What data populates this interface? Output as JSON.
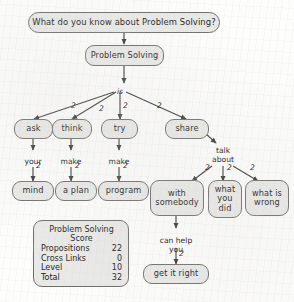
{
  "title_node": {
    "text": "What do you know about Problem Solving?"
  },
  "root_node": {
    "text": "Problem Solving"
  },
  "root_link": {
    "label": "is"
  },
  "level1": [
    {
      "name": "ask",
      "text": "ask"
    },
    {
      "name": "think",
      "text": "think"
    },
    {
      "name": "try",
      "text": "try"
    },
    {
      "name": "share",
      "text": "share"
    }
  ],
  "level1_counts": [
    "2",
    "2",
    "2",
    "2"
  ],
  "level2_links": [
    {
      "label": "your",
      "count": "2"
    },
    {
      "label": "make",
      "count": "2"
    },
    {
      "label": "make",
      "count": "2"
    },
    {
      "label": "talk\nabout",
      "count": null
    }
  ],
  "level2": [
    {
      "name": "mind",
      "text": "mind"
    },
    {
      "name": "a-plan",
      "text": "a plan"
    },
    {
      "name": "program",
      "text": "program"
    },
    {
      "name": "with-somebody",
      "text": "with\nsomebody"
    },
    {
      "name": "what-you-did",
      "text": "what\nyou\ndid"
    },
    {
      "name": "what-is-wrong",
      "text": "what is\nwrong"
    }
  ],
  "talk_about_counts": [
    "2",
    "2",
    "2"
  ],
  "level3_link": {
    "label": "can help\nyou",
    "count": "2"
  },
  "level3": [
    {
      "name": "get-it-right",
      "text": "get it right"
    }
  ],
  "score_box": {
    "title": "Problem Solving\nScore",
    "rows": [
      {
        "label": "Propositions",
        "value": "22"
      },
      {
        "label": "Cross Links",
        "value": "0"
      },
      {
        "label": "Level",
        "value": "10"
      },
      {
        "label": "Total",
        "value": "32"
      }
    ]
  },
  "colors": {
    "node_fill": "#e9e9e7",
    "node_border": "#6d6d6a",
    "edge": "#3a3a38",
    "text": "#1a1a1a",
    "background": "#fdfdfc"
  }
}
